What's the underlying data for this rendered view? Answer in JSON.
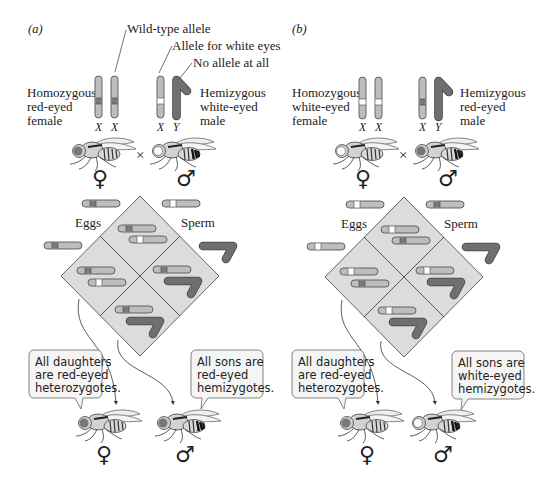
{
  "colors": {
    "chromosome_fill": "#bdbdbd",
    "chromosome_stroke": "#555555",
    "red_allele": "#7a7a7a",
    "white_allele": "#ffffff",
    "y_chromosome": "#6f6f6f",
    "diamond_fill": "#dcdcdc",
    "diamond_stroke": "#555555",
    "bubble_fill": "#f5f5f5"
  },
  "panels": [
    {
      "id": "a",
      "label": "(a)",
      "callouts": [
        "Wild-type allele",
        "Allele for white eyes",
        "No allele at all"
      ],
      "female_label": [
        "Homozygous",
        "red-eyed",
        "female"
      ],
      "male_label": [
        "Hemizygous",
        "white-eyed",
        "male"
      ],
      "female_chrom_labels": [
        "X",
        "X"
      ],
      "male_chrom_labels": [
        "X",
        "Y"
      ],
      "cross_symbol": "×",
      "female_symbol": "♀",
      "male_symbol": "♂",
      "eggs_label": "Eggs",
      "sperm_label": "Sperm",
      "daughters_bubble": [
        "All daughters",
        "are red-eyed",
        "heterozygotes."
      ],
      "sons_bubble": [
        "All sons are",
        "red-eyed",
        "hemizygotes."
      ],
      "offspring_female_symbol": "♀",
      "offspring_male_symbol": "♂"
    },
    {
      "id": "b",
      "label": "(b)",
      "female_label": [
        "Homozygous",
        "white-eyed",
        "female"
      ],
      "male_label": [
        "Hemizygous",
        "red-eyed",
        "male"
      ],
      "female_chrom_labels": [
        "X",
        "X"
      ],
      "male_chrom_labels": [
        "X",
        "Y"
      ],
      "cross_symbol": "×",
      "female_symbol": "♀",
      "male_symbol": "♂",
      "eggs_label": "Eggs",
      "sperm_label": "Sperm",
      "daughters_bubble": [
        "All daughters",
        "are red-eyed",
        "heterozygotes."
      ],
      "sons_bubble": [
        "All sons are",
        "white-eyed",
        "hemizygotes."
      ],
      "offspring_female_symbol": "♀",
      "offspring_male_symbol": "♂"
    }
  ]
}
